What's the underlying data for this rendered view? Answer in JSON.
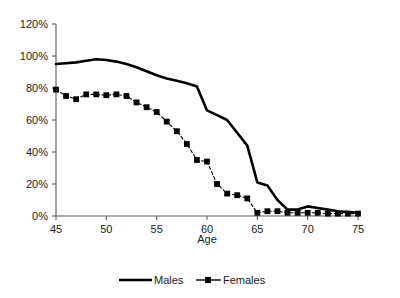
{
  "chart_data": {
    "type": "line",
    "title": "",
    "subtitle": "",
    "xlabel": "Age",
    "ylabel": "",
    "xlim": [
      45,
      75
    ],
    "ylim": [
      0,
      120
    ],
    "grid": false,
    "legend_position": "bottom",
    "x_tick_labels": [
      "45",
      "50",
      "55",
      "60",
      "65",
      "70",
      "75"
    ],
    "x_ticks": [
      45,
      50,
      55,
      60,
      65,
      70,
      75
    ],
    "y_tick_labels": [
      "0%",
      "20%",
      "40%",
      "60%",
      "80%",
      "100%",
      "120%"
    ],
    "y_ticks": [
      0,
      20,
      40,
      60,
      80,
      100,
      120
    ],
    "x": [
      45,
      46,
      47,
      48,
      49,
      50,
      51,
      52,
      53,
      54,
      55,
      56,
      57,
      58,
      59,
      60,
      61,
      62,
      63,
      64,
      65,
      66,
      67,
      68,
      69,
      70,
      71,
      72,
      73,
      74,
      75
    ],
    "series": [
      {
        "name": "Males",
        "marker": "none",
        "line_style": "solid",
        "color": "#000000",
        "values": [
          95,
          95.5,
          96,
          97,
          98,
          97.5,
          96.5,
          95,
          93,
          90.5,
          88,
          86,
          84.5,
          83,
          81,
          66,
          63,
          60,
          52,
          44,
          21,
          19,
          10,
          4,
          4,
          6,
          5,
          4,
          3,
          2.5,
          2
        ]
      },
      {
        "name": "Females",
        "marker": "square",
        "line_style": "dashed",
        "color": "#000000",
        "values": [
          79,
          75,
          73,
          76,
          76,
          75.5,
          76,
          75,
          71,
          68,
          65,
          59,
          53,
          45,
          35,
          34,
          20,
          14,
          13,
          11,
          2,
          3,
          3,
          2,
          2,
          2,
          2,
          1.5,
          1.5,
          1.5,
          1.5
        ]
      }
    ]
  },
  "legend": {
    "entries": [
      {
        "label": "Males"
      },
      {
        "label": "Females"
      }
    ]
  },
  "axes": {
    "x_title": "Age"
  },
  "colors": {
    "line": "#000000",
    "axis": "#595959",
    "text": "#1a1a1a",
    "background": "#ffffff"
  }
}
